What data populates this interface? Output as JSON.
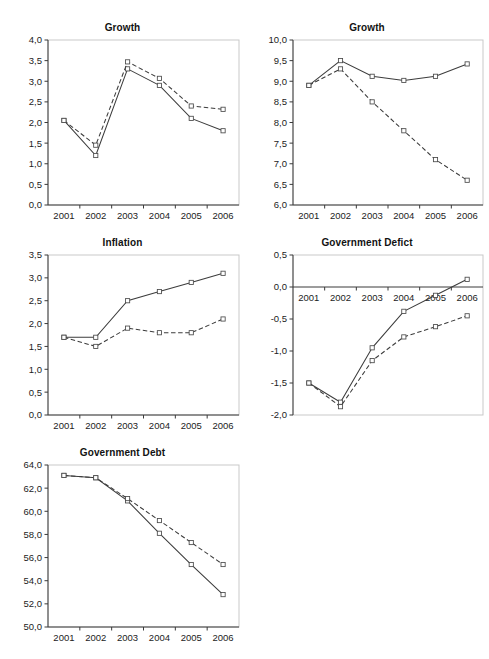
{
  "figure": {
    "panel_count": 5,
    "legend_present": false,
    "series_names": [
      "solid",
      "dashed"
    ],
    "x_categories": [
      "2001",
      "2002",
      "2003",
      "2004",
      "2005",
      "2006"
    ],
    "line_color": "#3c3c3c",
    "marker_color": "#4a4a4a",
    "frame_color": "#c9c9c9"
  },
  "chart_data": [
    {
      "id": "growth-1",
      "type": "line",
      "title": "Growth",
      "xlabel": "",
      "ylabel": "",
      "x": [
        "2001",
        "2002",
        "2003",
        "2004",
        "2005",
        "2006"
      ],
      "ylim": [
        0.0,
        4.0
      ],
      "yticks": [
        "0,0",
        "0,5",
        "1,0",
        "1,5",
        "2,0",
        "2,5",
        "3,0",
        "3,5",
        "4,0"
      ],
      "ytick_values": [
        0.0,
        0.5,
        1.0,
        1.5,
        2.0,
        2.5,
        3.0,
        3.5,
        4.0
      ],
      "grid": false,
      "legend": "none",
      "series": [
        {
          "name": "solid",
          "style": "solid",
          "values": [
            2.05,
            1.2,
            3.3,
            2.9,
            2.1,
            1.8
          ]
        },
        {
          "name": "dashed",
          "style": "dashed",
          "values": [
            2.05,
            1.45,
            3.47,
            3.07,
            2.4,
            2.32
          ]
        }
      ]
    },
    {
      "id": "growth-2",
      "type": "line",
      "title": "Growth",
      "xlabel": "",
      "ylabel": "",
      "x": [
        "2001",
        "2002",
        "2003",
        "2004",
        "2005",
        "2006"
      ],
      "ylim": [
        6.0,
        10.0
      ],
      "yticks": [
        "6,0",
        "6,5",
        "7,0",
        "7,5",
        "8,0",
        "8,5",
        "9,0",
        "9,5",
        "10,0"
      ],
      "ytick_values": [
        6.0,
        6.5,
        7.0,
        7.5,
        8.0,
        8.5,
        9.0,
        9.5,
        10.0
      ],
      "grid": false,
      "legend": "none",
      "series": [
        {
          "name": "solid",
          "style": "solid",
          "values": [
            8.9,
            9.5,
            9.12,
            9.02,
            9.12,
            9.42
          ]
        },
        {
          "name": "dashed",
          "style": "dashed",
          "values": [
            8.9,
            9.3,
            8.5,
            7.8,
            7.1,
            6.6
          ]
        }
      ]
    },
    {
      "id": "inflation",
      "type": "line",
      "title": "Inflation",
      "xlabel": "",
      "ylabel": "",
      "x": [
        "2001",
        "2002",
        "2003",
        "2004",
        "2005",
        "2006"
      ],
      "ylim": [
        0.0,
        3.5
      ],
      "yticks": [
        "0,0",
        "0,5",
        "1,0",
        "1,5",
        "2,0",
        "2,5",
        "3,0",
        "3,5"
      ],
      "ytick_values": [
        0.0,
        0.5,
        1.0,
        1.5,
        2.0,
        2.5,
        3.0,
        3.5
      ],
      "grid": false,
      "legend": "none",
      "series": [
        {
          "name": "solid",
          "style": "solid",
          "values": [
            1.7,
            1.7,
            2.5,
            2.7,
            2.9,
            3.1
          ]
        },
        {
          "name": "dashed",
          "style": "dashed",
          "values": [
            1.7,
            1.5,
            1.9,
            1.8,
            1.8,
            2.1
          ]
        }
      ]
    },
    {
      "id": "government-deficit",
      "type": "line",
      "title": "Government Defict",
      "xlabel": "",
      "ylabel": "",
      "x": [
        "2001",
        "2002",
        "2003",
        "2004",
        "2005",
        "2006"
      ],
      "ylim": [
        -2.0,
        0.5
      ],
      "yticks": [
        "-2,0",
        "-1,5",
        "-1,0",
        "-0,5",
        "0,0",
        "0,5"
      ],
      "ytick_values": [
        -2.0,
        -1.5,
        -1.0,
        -0.5,
        0.0,
        0.5
      ],
      "xaxis_at_zero": true,
      "grid": false,
      "legend": "none",
      "series": [
        {
          "name": "solid",
          "style": "solid",
          "values": [
            -1.5,
            -1.8,
            -0.95,
            -0.38,
            -0.13,
            0.12
          ]
        },
        {
          "name": "dashed",
          "style": "dashed",
          "values": [
            -1.5,
            -1.87,
            -1.15,
            -0.78,
            -0.62,
            -0.45
          ]
        }
      ]
    },
    {
      "id": "government-debt",
      "type": "line",
      "title": "Government Debt",
      "xlabel": "",
      "ylabel": "",
      "x": [
        "2001",
        "2002",
        "2003",
        "2004",
        "2005",
        "2006"
      ],
      "ylim": [
        50.0,
        64.0
      ],
      "yticks": [
        "50,0",
        "52,0",
        "54,0",
        "56,0",
        "58,0",
        "60,0",
        "62,0",
        "64,0"
      ],
      "ytick_values": [
        50.0,
        52.0,
        54.0,
        56.0,
        58.0,
        60.0,
        62.0,
        64.0
      ],
      "grid": false,
      "legend": "none",
      "series": [
        {
          "name": "solid",
          "style": "solid",
          "values": [
            63.1,
            62.9,
            60.9,
            58.1,
            55.4,
            52.8
          ]
        },
        {
          "name": "dashed",
          "style": "dashed",
          "values": [
            63.1,
            62.9,
            61.1,
            59.2,
            57.3,
            55.4
          ]
        }
      ]
    }
  ],
  "panels": [
    {
      "key": 0,
      "left": 0,
      "top": 22,
      "width": 245,
      "height": 215
    },
    {
      "key": 1,
      "left": 245,
      "top": 22,
      "width": 244,
      "height": 215
    },
    {
      "key": 2,
      "left": 0,
      "top": 237,
      "width": 245,
      "height": 210
    },
    {
      "key": 3,
      "left": 245,
      "top": 237,
      "width": 244,
      "height": 210
    },
    {
      "key": 4,
      "left": 0,
      "top": 447,
      "width": 245,
      "height": 212
    }
  ]
}
